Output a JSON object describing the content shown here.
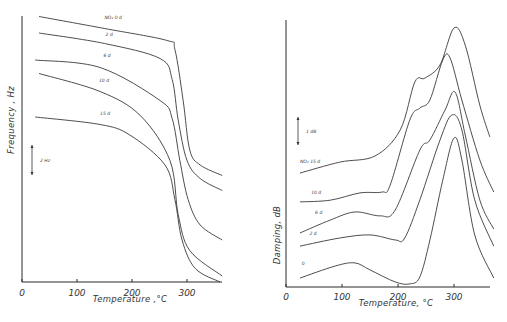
{
  "chart_data": [
    {
      "type": "line",
      "title": "",
      "xlabel": "Temperature ,°C",
      "ylabel": "Frequency , Hz",
      "xlim": [
        0,
        370
      ],
      "ylim": [
        0,
        17.7
      ],
      "xticks": [
        0,
        100,
        200,
        300
      ],
      "xtick_labels": [
        "0",
        "100",
        "200",
        "300"
      ],
      "scale_bar": {
        "label": "2 Hz",
        "value": 2
      },
      "grid": false,
      "series": [
        {
          "name": "NO₂ 0 d",
          "label": "NO₂ 0 d",
          "x": [
            31,
            150,
            264,
            278,
            293,
            305,
            324,
            364
          ],
          "y": [
            17.7,
            16.9,
            16.1,
            15.5,
            12.1,
            8.8,
            7.8,
            7.1
          ]
        },
        {
          "name": "2 d",
          "label": "2 d",
          "x": [
            31,
            150,
            251,
            273,
            284,
            300,
            324,
            364
          ],
          "y": [
            16.6,
            15.9,
            14.9,
            13.5,
            10.8,
            8.1,
            6.9,
            6.1
          ]
        },
        {
          "name": "6 d",
          "label": "6 d",
          "x": [
            24,
            142,
            251,
            273,
            287,
            302,
            324,
            364
          ],
          "y": [
            14.8,
            14.3,
            12.1,
            10.9,
            8.1,
            5.5,
            3.8,
            2.8
          ]
        },
        {
          "name": "10 d",
          "label": "10 d",
          "x": [
            31,
            142,
            215,
            269,
            284,
            305,
            364
          ],
          "y": [
            13.9,
            12.7,
            11.1,
            8.1,
            4.5,
            2.1,
            0.4
          ]
        },
        {
          "name": "15 d",
          "label": "15 d",
          "x": [
            24,
            142,
            196,
            260,
            278,
            291,
            315,
            360
          ],
          "y": [
            11.0,
            10.5,
            9.8,
            7.8,
            5.5,
            2.8,
            0.9,
            0.0
          ]
        }
      ]
    },
    {
      "type": "line",
      "title": "",
      "xlabel": "Temperature, °C",
      "ylabel": "Damping, dB",
      "xlim": [
        0,
        370
      ],
      "ylim": [
        0,
        9.7
      ],
      "xticks": [
        0,
        100,
        200,
        300
      ],
      "xtick_labels": [
        "0",
        "100",
        "200",
        "300"
      ],
      "scale_bar": {
        "label": "1 dB",
        "value": 1
      },
      "grid": false,
      "series": [
        {
          "name": "NO₂ 15 d",
          "label": "NO₂ 15 d",
          "x": [
            25,
            96,
            159,
            204,
            230,
            248,
            275,
            300,
            320,
            346,
            364
          ],
          "y": [
            4.07,
            4.46,
            4.68,
            5.61,
            7.32,
            7.46,
            7.93,
            9.25,
            8.64,
            6.5,
            5.36
          ]
        },
        {
          "name": "10 d",
          "label": "10 d",
          "x": [
            25,
            79,
            132,
            171,
            186,
            221,
            239,
            257,
            280,
            293,
            314,
            346,
            371
          ],
          "y": [
            3.04,
            3.1,
            3.36,
            3.39,
            3.64,
            5.96,
            6.39,
            6.68,
            8.11,
            8.18,
            6.68,
            4.54,
            3.39
          ]
        },
        {
          "name": "6 d",
          "label": "6 d",
          "x": [
            25,
            79,
            123,
            168,
            195,
            239,
            257,
            284,
            302,
            320,
            346,
            371
          ],
          "y": [
            1.93,
            2.39,
            2.68,
            2.54,
            2.75,
            4.89,
            5.25,
            6.32,
            6.96,
            5.43,
            3.11,
            2.07
          ]
        },
        {
          "name": "2 d",
          "label": "2 d",
          "x": [
            25,
            96,
            150,
            195,
            212,
            239,
            275,
            296,
            314,
            337,
            371
          ],
          "y": [
            1.46,
            1.75,
            1.86,
            1.68,
            1.75,
            3.11,
            5.25,
            6.14,
            5.61,
            3.11,
            1.46
          ]
        },
        {
          "name": "0",
          "label": "0",
          "x": [
            25,
            88,
            123,
            150,
            195,
            221,
            239,
            257,
            280,
            300,
            314,
            337,
            371
          ],
          "y": [
            0.32,
            0.75,
            0.86,
            0.61,
            0.18,
            0.11,
            0.36,
            1.68,
            3.82,
            5.32,
            4.54,
            1.86,
            0.32
          ]
        }
      ]
    }
  ]
}
